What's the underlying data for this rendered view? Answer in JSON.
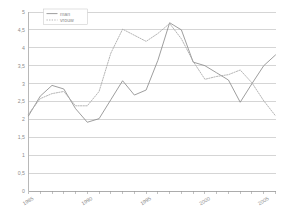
{
  "chart_data": {
    "type": "line",
    "title": "",
    "xlabel": "",
    "ylabel": "",
    "xlim": [
      1985,
      2006
    ],
    "ylim": [
      0,
      5
    ],
    "ytick_step": 0.5,
    "grid": true,
    "legend_position": "top-left",
    "ytick_labels": [
      "5",
      "4,5",
      "4",
      "3,5",
      "3",
      "2,5",
      "2",
      "1,5",
      "1",
      "0,5",
      "0"
    ],
    "ytick_values": [
      5,
      4.5,
      4,
      3.5,
      3,
      2.5,
      2,
      1.5,
      1,
      0.5,
      0
    ],
    "xtick_labels": [
      "1985",
      "1990",
      "1995",
      "2000",
      "2005"
    ],
    "xtick_values": [
      1985,
      1990,
      1995,
      2000,
      2005
    ],
    "x": [
      1985,
      1986,
      1987,
      1988,
      1989,
      1990,
      1991,
      1992,
      1993,
      1994,
      1995,
      1996,
      1997,
      1998,
      1999,
      2000,
      2001,
      2002,
      2003,
      2004,
      2005,
      2006
    ],
    "series": [
      {
        "name": "man",
        "style": "solid",
        "color": "#8c8c8c",
        "values": [
          2.1,
          2.65,
          2.95,
          2.85,
          2.3,
          1.92,
          2.02,
          2.55,
          3.08,
          2.68,
          2.82,
          3.65,
          4.7,
          4.5,
          3.6,
          3.5,
          3.3,
          3.1,
          2.48,
          3.0,
          3.5,
          3.8
        ]
      },
      {
        "name": "vrouw",
        "style": "dotted",
        "color": "#a8a8a8",
        "values": [
          2.15,
          2.58,
          2.72,
          2.78,
          2.38,
          2.38,
          2.78,
          3.85,
          4.52,
          4.35,
          4.18,
          4.4,
          4.68,
          4.25,
          3.62,
          3.12,
          3.2,
          3.25,
          3.38,
          3.02,
          2.52,
          2.1
        ]
      }
    ]
  },
  "legend": {
    "items": [
      {
        "label": "man"
      },
      {
        "label": "vrouw"
      }
    ]
  }
}
